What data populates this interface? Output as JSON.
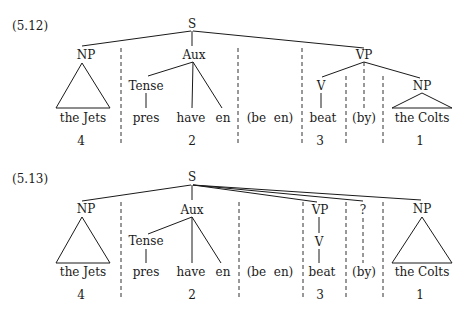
{
  "colors": {
    "ink": "#1a1a1a",
    "background": "#ffffff"
  },
  "diagrams": [
    {
      "label": "(5.12)",
      "root": "S",
      "nodes": {
        "np_subject": "NP",
        "aux": "Aux",
        "vp": "VP",
        "tense": "Tense",
        "v": "V",
        "np_object": "NP"
      },
      "words": {
        "subject": "the Jets",
        "pres": "pres",
        "have": "have",
        "en": "en",
        "be_en": "(be  en)",
        "verb": "beat",
        "by": "(by)",
        "object": "the Colts"
      },
      "indices": {
        "subject": "4",
        "aux": "2",
        "verb": "3",
        "object": "1"
      }
    },
    {
      "label": "(5.13)",
      "root": "S",
      "nodes": {
        "np_subject": "NP",
        "aux": "Aux",
        "vp": "VP",
        "unknown": "?",
        "tense": "Tense",
        "v": "V",
        "np_object": "NP"
      },
      "words": {
        "subject": "the Jets",
        "pres": "pres",
        "have": "have",
        "en": "en",
        "be_en": "(be  en)",
        "verb": "beat",
        "by": "(by)",
        "object": "the Colts"
      },
      "indices": {
        "subject": "4",
        "aux": "2",
        "verb": "3",
        "object": "1"
      }
    }
  ]
}
